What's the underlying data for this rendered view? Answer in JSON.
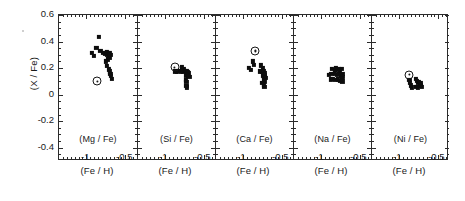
{
  "chart_data": {
    "type": "scatter",
    "title": "",
    "ylabel": "(X / Fe)",
    "xlabel": "(Fe / H)",
    "ylim": [
      -0.5,
      0.6
    ],
    "xlim": [
      -1.35,
      -0.35
    ],
    "yticks": [
      0.6,
      0.4,
      0.2,
      0,
      -0.2,
      -0.4
    ],
    "ytick_labels": [
      "0.6",
      "0.4",
      "0.2",
      "0",
      "-0.2",
      "-0.4"
    ],
    "xticks": [
      -1.0,
      -0.5
    ],
    "xtick_labels": [
      "-1",
      "-0.5"
    ],
    "grid": false,
    "legend": "none",
    "marker_legend": [
      {
        "name": "filled-square",
        "meaning": "program star",
        "color": "#0d0d0d"
      },
      {
        "name": "sun-symbol",
        "meaning": "solar / reference value",
        "color": "#161616"
      }
    ],
    "panels": [
      {
        "label": "(Mg / Fe)",
        "series": [
          {
            "name": "stars",
            "marker": "filled-square",
            "points": [
              [
                -0.84,
                0.435
              ],
              [
                -0.87,
                0.355
              ],
              [
                -0.93,
                0.315
              ],
              [
                -0.9,
                0.29
              ],
              [
                -0.82,
                0.33
              ],
              [
                -0.79,
                0.315
              ],
              [
                -0.76,
                0.31
              ],
              [
                -0.74,
                0.325
              ],
              [
                -0.73,
                0.3
              ],
              [
                -0.72,
                0.315
              ],
              [
                -0.71,
                0.295
              ],
              [
                -0.7,
                0.31
              ],
              [
                -0.7,
                0.28
              ],
              [
                -0.69,
                0.3
              ],
              [
                -0.72,
                0.265
              ],
              [
                -0.75,
                0.25
              ],
              [
                -0.74,
                0.215
              ],
              [
                -0.71,
                0.19
              ],
              [
                -0.7,
                0.175
              ],
              [
                -0.69,
                0.155
              ],
              [
                -0.68,
                0.14
              ],
              [
                -0.67,
                0.12
              ]
            ]
          },
          {
            "name": "sun",
            "marker": "sun-symbol",
            "points": [
              [
                -0.86,
                0.1
              ]
            ]
          }
        ]
      },
      {
        "label": "(Si / Fe)",
        "series": [
          {
            "name": "stars",
            "marker": "filled-square",
            "points": [
              [
                -0.79,
                0.205
              ],
              [
                -0.76,
                0.195
              ],
              [
                -0.87,
                0.175
              ],
              [
                -0.85,
                0.17
              ],
              [
                -0.82,
                0.18
              ],
              [
                -0.8,
                0.17
              ],
              [
                -0.77,
                0.175
              ],
              [
                -0.75,
                0.18
              ],
              [
                -0.74,
                0.17
              ],
              [
                -0.73,
                0.175
              ],
              [
                -0.72,
                0.165
              ],
              [
                -0.71,
                0.17
              ],
              [
                -0.7,
                0.16
              ],
              [
                -0.73,
                0.145
              ],
              [
                -0.71,
                0.14
              ],
              [
                -0.69,
                0.135
              ],
              [
                -0.74,
                0.11
              ],
              [
                -0.73,
                0.095
              ],
              [
                -0.73,
                0.065
              ],
              [
                -0.72,
                0.055
              ]
            ]
          },
          {
            "name": "sun",
            "marker": "sun-symbol",
            "points": [
              [
                -0.88,
                0.205
              ]
            ]
          }
        ]
      },
      {
        "label": "(Ca / Fe)",
        "series": [
          {
            "name": "stars",
            "marker": "filled-square",
            "points": [
              [
                -0.88,
                0.25
              ],
              [
                -0.86,
                0.225
              ],
              [
                -0.93,
                0.2
              ],
              [
                -0.9,
                0.185
              ],
              [
                -0.77,
                0.22
              ],
              [
                -0.75,
                0.2
              ],
              [
                -0.79,
                0.175
              ],
              [
                -0.76,
                0.17
              ],
              [
                -0.74,
                0.18
              ],
              [
                -0.73,
                0.16
              ],
              [
                -0.75,
                0.145
              ],
              [
                -0.73,
                0.135
              ],
              [
                -0.72,
                0.15
              ],
              [
                -0.71,
                0.125
              ],
              [
                -0.74,
                0.11
              ],
              [
                -0.72,
                0.1
              ],
              [
                -0.76,
                0.09
              ],
              [
                -0.74,
                0.075
              ],
              [
                -0.73,
                0.06
              ]
            ]
          },
          {
            "name": "sun",
            "marker": "sun-symbol",
            "points": [
              [
                -0.85,
                0.33
              ]
            ]
          }
        ]
      },
      {
        "label": "(Na / Fe)",
        "series": [
          {
            "name": "stars",
            "marker": "filled-square",
            "points": [
              [
                -0.86,
                0.195
              ],
              [
                -0.83,
                0.185
              ],
              [
                -0.81,
                0.2
              ],
              [
                -0.78,
                0.19
              ],
              [
                -0.76,
                0.175
              ],
              [
                -0.74,
                0.195
              ],
              [
                -0.9,
                0.15
              ],
              [
                -0.87,
                0.155
              ],
              [
                -0.83,
                0.16
              ],
              [
                -0.8,
                0.15
              ],
              [
                -0.77,
                0.155
              ],
              [
                -0.75,
                0.145
              ],
              [
                -0.73,
                0.155
              ],
              [
                -0.72,
                0.135
              ],
              [
                -0.88,
                0.115
              ],
              [
                -0.85,
                0.12
              ],
              [
                -0.82,
                0.11
              ],
              [
                -0.79,
                0.115
              ],
              [
                -0.76,
                0.105
              ],
              [
                -0.74,
                0.115
              ],
              [
                -0.73,
                0.1
              ]
            ]
          }
        ]
      },
      {
        "label": "(Ni / Fe)",
        "series": [
          {
            "name": "stars",
            "marker": "filled-square",
            "points": [
              [
                -0.87,
                0.11
              ],
              [
                -0.86,
                0.09
              ],
              [
                -0.85,
                0.07
              ],
              [
                -0.84,
                0.055
              ],
              [
                -0.79,
                0.12
              ],
              [
                -0.77,
                0.105
              ],
              [
                -0.76,
                0.09
              ],
              [
                -0.75,
                0.095
              ],
              [
                -0.74,
                0.08
              ],
              [
                -0.73,
                0.085
              ],
              [
                -0.73,
                0.065
              ],
              [
                -0.72,
                0.075
              ],
              [
                -0.71,
                0.06
              ],
              [
                -0.78,
                0.06
              ],
              [
                -0.76,
                0.05
              ]
            ]
          },
          {
            "name": "sun",
            "marker": "sun-symbol",
            "points": [
              [
                -0.87,
                0.15
              ]
            ]
          }
        ]
      }
    ]
  }
}
